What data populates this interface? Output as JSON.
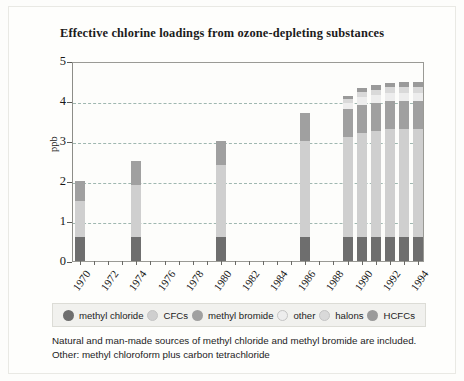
{
  "chart_data": {
    "type": "bar",
    "subtype": "stacked-bar",
    "title": "Effective chlorine loadings from ozone-depleting substances",
    "xlabel": "",
    "ylabel": "ppb",
    "ylim": [
      0,
      5
    ],
    "yticks": [
      0,
      1,
      2,
      3,
      4,
      5
    ],
    "ytick_labels": [
      "0",
      "1",
      "2",
      "3",
      "4",
      "5"
    ],
    "gridlines": [
      1,
      2,
      3,
      4
    ],
    "grid": true,
    "grid_style": "dashed",
    "legend_position": "bottom",
    "x": [
      1970,
      1971,
      1972,
      1973,
      1974,
      1975,
      1976,
      1977,
      1978,
      1979,
      1980,
      1981,
      1982,
      1983,
      1984,
      1985,
      1986,
      1987,
      1988,
      1989,
      1990,
      1991,
      1992,
      1993,
      1994
    ],
    "xtick_labels": [
      "1970",
      "1972",
      "1974",
      "1976",
      "1978",
      "1980",
      "1982",
      "1984",
      "1986",
      "1988",
      "1990",
      "1992",
      "1994"
    ],
    "xtick_years": [
      1970,
      1972,
      1974,
      1976,
      1978,
      1980,
      1982,
      1984,
      1986,
      1988,
      1990,
      1992,
      1994
    ],
    "categories": [
      "1970",
      "1974",
      "1980",
      "1986",
      "1989",
      "1990",
      "1991",
      "1992",
      "1993",
      "1994"
    ],
    "series": [
      {
        "name": "methyl chloride",
        "color": "#6e6e6e",
        "values": [
          0.6,
          0.6,
          0.6,
          0.6,
          0.6,
          0.6,
          0.6,
          0.6,
          0.6,
          0.6
        ]
      },
      {
        "name": "CFCs",
        "color": "#cfcfcf",
        "values": [
          0.9,
          1.3,
          1.8,
          2.4,
          2.5,
          2.6,
          2.65,
          2.7,
          2.7,
          2.7
        ]
      },
      {
        "name": "methyl bromide",
        "color": "#a0a0a0",
        "values": [
          0.5,
          0.6,
          0.6,
          0.7,
          0.7,
          0.7,
          0.7,
          0.7,
          0.7,
          0.7
        ]
      },
      {
        "name": "other",
        "color": "#ededed",
        "values": [
          0.0,
          0.0,
          0.0,
          0.0,
          0.15,
          0.2,
          0.2,
          0.2,
          0.2,
          0.2
        ]
      },
      {
        "name": "halons",
        "color": "#d9d9d9",
        "values": [
          0.0,
          0.0,
          0.0,
          0.0,
          0.1,
          0.12,
          0.13,
          0.14,
          0.14,
          0.14
        ]
      },
      {
        "name": "HCFCs",
        "color": "#9a9a9a",
        "values": [
          0.0,
          0.0,
          0.0,
          0.0,
          0.08,
          0.1,
          0.11,
          0.12,
          0.13,
          0.14
        ]
      }
    ],
    "bars": [
      {
        "year": 1970,
        "total": 2.0,
        "segments": [
          0.6,
          0.9,
          0.5,
          0.0,
          0.0,
          0.0
        ]
      },
      {
        "year": 1974,
        "total": 2.5,
        "segments": [
          0.6,
          1.3,
          0.6,
          0.0,
          0.0,
          0.0
        ]
      },
      {
        "year": 1980,
        "total": 3.0,
        "segments": [
          0.6,
          1.8,
          0.6,
          0.0,
          0.0,
          0.0
        ]
      },
      {
        "year": 1986,
        "total": 3.7,
        "segments": [
          0.6,
          2.4,
          0.7,
          0.0,
          0.0,
          0.0
        ]
      },
      {
        "year": 1989,
        "total": 4.13,
        "segments": [
          0.6,
          2.5,
          0.7,
          0.15,
          0.1,
          0.08
        ]
      },
      {
        "year": 1990,
        "total": 4.32,
        "segments": [
          0.6,
          2.6,
          0.7,
          0.2,
          0.12,
          0.1
        ]
      },
      {
        "year": 1991,
        "total": 4.39,
        "segments": [
          0.6,
          2.65,
          0.7,
          0.2,
          0.13,
          0.11
        ]
      },
      {
        "year": 1992,
        "total": 4.46,
        "segments": [
          0.6,
          2.7,
          0.7,
          0.2,
          0.14,
          0.12
        ]
      },
      {
        "year": 1993,
        "total": 4.47,
        "segments": [
          0.6,
          2.7,
          0.7,
          0.2,
          0.14,
          0.13
        ]
      },
      {
        "year": 1994,
        "total": 4.48,
        "segments": [
          0.6,
          2.7,
          0.7,
          0.2,
          0.14,
          0.14
        ]
      }
    ]
  },
  "legend": {
    "items": [
      {
        "label": "methyl chloride",
        "color": "#6e6e6e"
      },
      {
        "label": "CFCs",
        "color": "#cfcfcf"
      },
      {
        "label": "methyl bromide",
        "color": "#a0a0a0"
      },
      {
        "label": "other",
        "color": "#ededed"
      },
      {
        "label": "halons",
        "color": "#d9d9d9"
      },
      {
        "label": "HCFCs",
        "color": "#9a9a9a"
      }
    ]
  },
  "caption": {
    "line1": "Natural and man-made sources of methyl chloride and methyl bromide are included.",
    "line2": "Other: methyl chloroform plus carbon tetrachloride"
  },
  "colors": {
    "background": "#fdfdfb",
    "axis": "#8d8d88",
    "grid": "#9fb7b0",
    "text": "#1b1b1b",
    "legend_background": "#f1f1ee"
  }
}
